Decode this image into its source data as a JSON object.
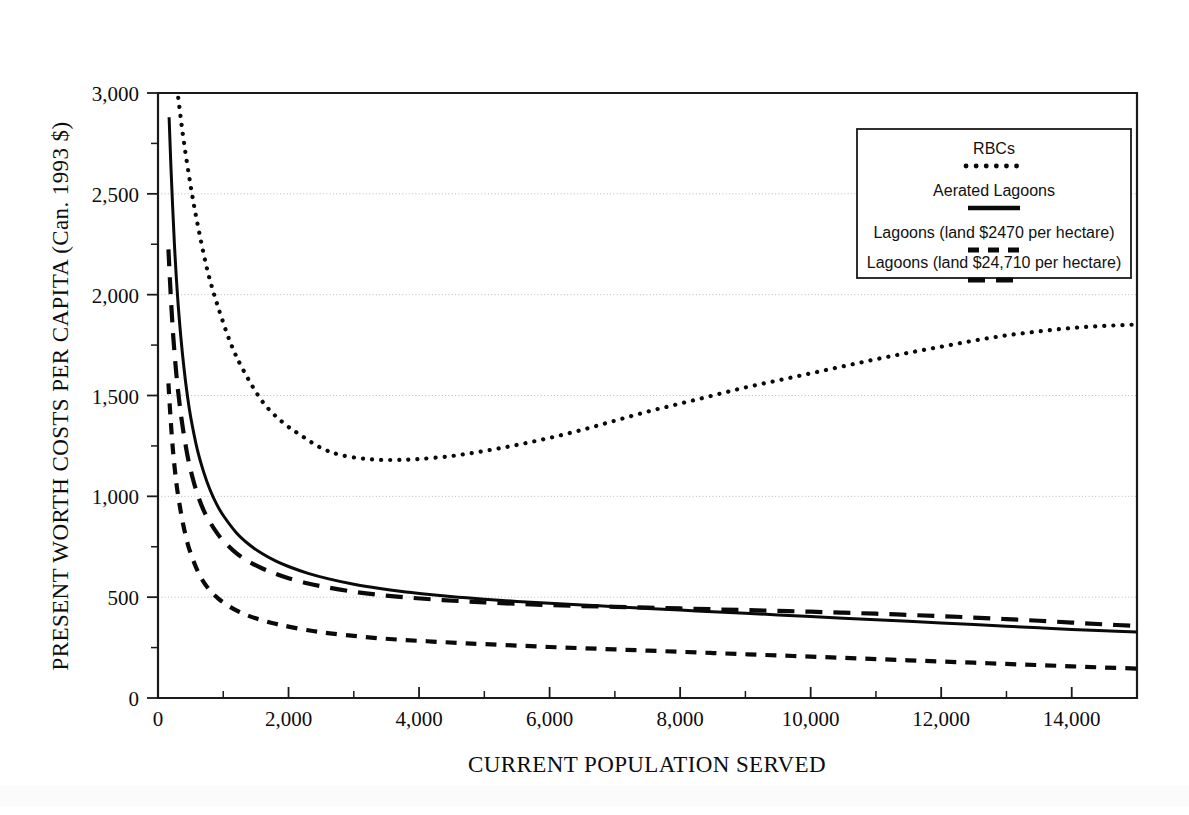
{
  "figure": {
    "background": "#ffffff",
    "ink_color": "#0a0a0a",
    "grid_color": "#b9b9b9"
  },
  "axes": {
    "x_title": "CURRENT POPULATION SERVED",
    "y_title": "PRESENT WORTH COSTS PER CAPITA (Can. 1993 $)",
    "x_ticks": [
      "0",
      "2,000",
      "4,000",
      "6,000",
      "8,000",
      "10,000",
      "12,000",
      "14,000"
    ],
    "x_tick_values": [
      0,
      2000,
      4000,
      6000,
      8000,
      10000,
      12000,
      14000
    ],
    "y_ticks": [
      "0",
      "500",
      "1,000",
      "1,500",
      "2,000",
      "2,500",
      "3,000"
    ],
    "y_tick_values": [
      0,
      500,
      1000,
      1500,
      2000,
      2500,
      3000
    ],
    "x_minor_step": 1000,
    "y_minor_step": 250
  },
  "legend": {
    "position": "top-right-inside",
    "entries": [
      {
        "label": "RBCs",
        "style": "dotted"
      },
      {
        "label": "Aerated Lagoons",
        "style": "solid"
      },
      {
        "label": "Lagoons (land $2470 per hectare)",
        "style": "dashed-short"
      },
      {
        "label": "Lagoons (land $24,710 per hectare)",
        "style": "dashed-long"
      }
    ]
  },
  "chart_data": {
    "type": "line",
    "title": "",
    "subtitle": "",
    "xlabel": "CURRENT POPULATION SERVED",
    "ylabel": "PRESENT WORTH COSTS PER CAPITA (Can. 1993 $)",
    "xlim": [
      0,
      15000
    ],
    "ylim": [
      0,
      3000
    ],
    "grid": true,
    "legend_position": "top-right-inside",
    "series": [
      {
        "name": "RBCs",
        "style": "dotted",
        "x": [
          180,
          250,
          320,
          400,
          500,
          600,
          750,
          900,
          1100,
          1300,
          1600,
          1900,
          2200,
          2500,
          2800,
          3200,
          3600,
          4000,
          4500,
          5000,
          5500,
          6000,
          6500,
          7000,
          7500,
          8000,
          8500,
          9000,
          9500,
          10000,
          10500,
          11000,
          11500,
          12000,
          12500,
          13000,
          13500,
          14000,
          14500,
          15000
        ],
        "y": [
          3380,
          3150,
          2950,
          2750,
          2540,
          2360,
          2130,
          1960,
          1770,
          1630,
          1470,
          1370,
          1300,
          1240,
          1205,
          1185,
          1180,
          1185,
          1200,
          1225,
          1255,
          1290,
          1330,
          1375,
          1420,
          1460,
          1500,
          1540,
          1575,
          1610,
          1645,
          1680,
          1712,
          1742,
          1772,
          1798,
          1818,
          1835,
          1845,
          1852
        ]
      },
      {
        "name": "Aerated Lagoons",
        "style": "solid",
        "x": [
          170,
          200,
          250,
          300,
          350,
          400,
          450,
          500,
          600,
          700,
          800,
          900,
          1000,
          1200,
          1400,
          1600,
          1800,
          2000,
          2300,
          2600,
          3000,
          3400,
          3800,
          4200,
          4600,
          5000,
          5500,
          6000,
          6500,
          7000,
          7500,
          8000,
          8500,
          9000,
          9500,
          10000,
          10500,
          11000,
          11500,
          12000,
          12500,
          13000,
          13500,
          14000,
          14500,
          15000
        ],
        "y": [
          2880,
          2620,
          2260,
          1990,
          1790,
          1630,
          1500,
          1395,
          1235,
          1120,
          1030,
          960,
          905,
          820,
          760,
          715,
          680,
          652,
          618,
          592,
          564,
          543,
          526,
          512,
          500,
          490,
          479,
          470,
          461,
          453,
          444,
          436,
          428,
          420,
          412,
          404,
          396,
          388,
          380,
          372,
          364,
          356,
          348,
          340,
          333,
          327
        ]
      },
      {
        "name": "Lagoons (land $24,710 per hectare)",
        "style": "dashed-long",
        "x": [
          160,
          190,
          230,
          280,
          330,
          380,
          450,
          520,
          600,
          700,
          800,
          900,
          1000,
          1200,
          1400,
          1600,
          1800,
          2000,
          2300,
          2600,
          3000,
          3400,
          3800,
          4200,
          4600,
          5000,
          5500,
          6000,
          6500,
          7000,
          7500,
          8000,
          8500,
          9000,
          9500,
          10000,
          10500,
          11000,
          11500,
          12000,
          12500,
          13000,
          13500,
          14000,
          14500,
          15000
        ],
        "y": [
          2225,
          2030,
          1810,
          1610,
          1460,
          1340,
          1205,
          1105,
          1015,
          930,
          870,
          820,
          780,
          718,
          675,
          642,
          616,
          594,
          568,
          548,
          527,
          511,
          499,
          489,
          481,
          474,
          467,
          461,
          456,
          452,
          448,
          444,
          440,
          436,
          432,
          428,
          423,
          418,
          412,
          406,
          399,
          391,
          383,
          374,
          365,
          357
        ]
      },
      {
        "name": "Lagoons (land $2470 per hectare)",
        "style": "dashed-short",
        "x": [
          160,
          190,
          230,
          280,
          330,
          380,
          450,
          520,
          600,
          700,
          800,
          900,
          1000,
          1200,
          1400,
          1600,
          1800,
          2000,
          2300,
          2600,
          3000,
          3400,
          3800,
          4200,
          4600,
          5000,
          5500,
          6000,
          6500,
          7000,
          7500,
          8000,
          8500,
          9000,
          9500,
          10000,
          10500,
          11000,
          11500,
          12000,
          12500,
          13000,
          13500,
          14000,
          14500,
          15000
        ],
        "y": [
          1560,
          1400,
          1225,
          1070,
          960,
          870,
          770,
          700,
          635,
          575,
          532,
          500,
          474,
          434,
          406,
          385,
          368,
          354,
          336,
          322,
          308,
          296,
          287,
          280,
          273,
          267,
          260,
          253,
          247,
          241,
          235,
          229,
          223,
          217,
          211,
          205,
          199,
          193,
          187,
          181,
          175,
          169,
          163,
          157,
          151,
          146
        ]
      }
    ]
  }
}
